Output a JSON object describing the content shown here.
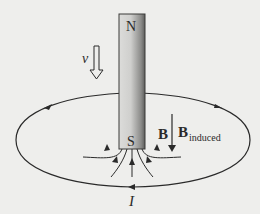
{
  "diagram": {
    "magnet": {
      "north_label": "N",
      "south_label": "S"
    },
    "velocity": {
      "label": "v",
      "direction": "down"
    },
    "field_labels": {
      "b_label": "B",
      "b_induced_main": "B",
      "b_induced_sub": "induced"
    },
    "current": {
      "label": "I",
      "direction": "counterclockwise-as-drawn (arrows: left on front, right on back)"
    },
    "colors": {
      "background": "#eeeeec",
      "line": "#2a2a2a",
      "magnet_light": "#e4e4e2",
      "magnet_dark": "#6a6a68"
    }
  }
}
